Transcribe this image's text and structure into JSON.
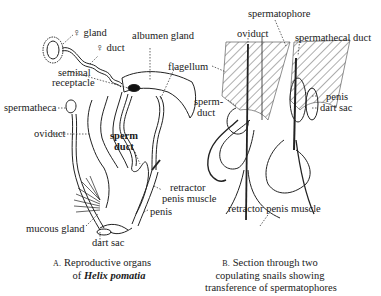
{
  "figure_a": {
    "labels": {
      "gland": "♀ gland",
      "duct": "♀ duct",
      "albumen_gland": "albumen gland",
      "seminal_receptacle_1": "seminal",
      "seminal_receptacle_2": "receptacle",
      "flagellum": "flagellum",
      "spermatheca": "spermatheca",
      "oviduct": "oviduct",
      "sperm_duct_1": "sperm",
      "sperm_duct_2": "duct",
      "retractor_1": "retractor",
      "retractor_2": "penis muscle",
      "penis": "penis",
      "mucous_gland": "mucous gland",
      "dart_sac": "dart sac"
    },
    "caption": {
      "letter": "A.",
      "line1": "Reproductive organs",
      "line2_prefix": "of",
      "species": "Helix pomatia"
    }
  },
  "figure_b": {
    "labels": {
      "spermatophore": "spermatophore",
      "oviduct": "oviduct",
      "spermathecal_duct": "spermathecal duct",
      "sperm_duct_1": "sperm-",
      "sperm_duct_2": "duct",
      "penis": "penis",
      "dart_sac": "dart sac",
      "retractor_penis_muscle": "retractor penis muscle"
    },
    "caption": {
      "letter": "B.",
      "line1": "Section through two",
      "line2": "copulating snails showing",
      "line3": "transference of spermatophores"
    }
  }
}
